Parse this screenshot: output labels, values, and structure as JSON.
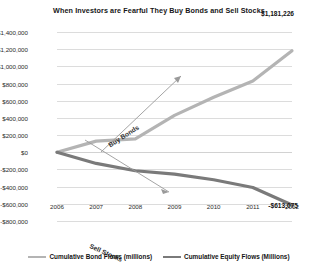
{
  "chart_data": {
    "type": "line",
    "title": "When Investors are Fearful They Buy Bonds and Sell Stocks",
    "xlabel": "",
    "ylabel": "",
    "categories": [
      "2006",
      "2007",
      "2008",
      "2009",
      "2010",
      "2011",
      "2012"
    ],
    "series": [
      {
        "name": "Cumulative Bond Flows (millions)",
        "color": "#b4b4b4",
        "values": [
          0,
          130000,
          155000,
          430000,
          640000,
          830000,
          1181226
        ],
        "end_label": "$1,181,226"
      },
      {
        "name": "Cumulative Equity Flows (Millions)",
        "color": "#7a7a7a",
        "values": [
          0,
          -130000,
          -215000,
          -255000,
          -320000,
          -410000,
          -613075
        ],
        "end_label": "-$613,075"
      }
    ],
    "ylim": [
      -800000,
      1400000
    ],
    "ytick_values": [
      1400000,
      1200000,
      1000000,
      800000,
      600000,
      400000,
      200000,
      0,
      -200000,
      -400000,
      -600000,
      -800000
    ],
    "ytick_labels": [
      "$1,400,000",
      "$1,200,000",
      "$1,000,000",
      "$800,000",
      "$600,000",
      "$400,000",
      "$200,000",
      "$0",
      "-$200,000",
      "-$400,000",
      "-$600,000",
      "-$800,000"
    ],
    "grid": true,
    "legend_position": "bottom",
    "annotations": [
      {
        "text": "Buy Bonds",
        "direction": "up-right"
      },
      {
        "text": "Sell Stocks",
        "direction": "down-right"
      }
    ]
  },
  "colors": {
    "grid": "#dcdcdc",
    "text": "#1a1a1a",
    "background": "#ffffff"
  }
}
